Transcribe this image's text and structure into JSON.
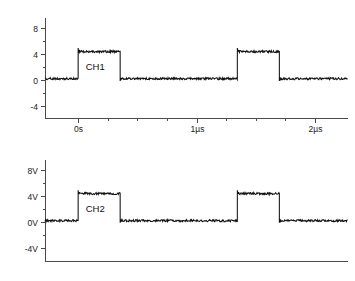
{
  "figure": {
    "title": "",
    "background": "#ffffff",
    "trace_color": "#111111",
    "axis_color": "#4a4a4a"
  },
  "panels": [
    {
      "id": "ch1",
      "channel_label": "CH1",
      "y_ticks": [
        "8",
        "4",
        "0",
        "-4"
      ],
      "y_values": [
        8,
        4,
        0,
        -4
      ],
      "x_ticks": [
        "0s",
        "1µs",
        "2µs"
      ],
      "x_values": [
        0,
        1,
        2
      ]
    },
    {
      "id": "ch2",
      "channel_label": "CH2",
      "y_ticks": [
        "8V",
        "4V",
        "0V",
        "-4V"
      ],
      "y_values": [
        8,
        4,
        0,
        -4
      ],
      "x_ticks": [],
      "x_values": []
    }
  ],
  "chart_data": [
    {
      "type": "line",
      "title": "",
      "xlabel": "",
      "ylabel": "",
      "series_name": "CH1",
      "xlim": [
        -0.28,
        2.28
      ],
      "ylim": [
        -6.2,
        9.6
      ],
      "yticks": [
        8,
        4,
        0,
        -4
      ],
      "yticklabels": [
        "8",
        "4",
        "0",
        "-4"
      ],
      "yminorticks": [
        6,
        2,
        -2
      ],
      "xticks": [
        0,
        1,
        2
      ],
      "xticklabels": [
        "0s",
        "1µs",
        "2µs"
      ],
      "xminorticks": [
        0.25,
        0.5,
        0.75,
        1.25,
        1.5,
        1.75
      ],
      "grid": false,
      "legend": "none",
      "annotations": [
        {
          "text": "CH1",
          "x": 0.03,
          "y": 1.55
        }
      ],
      "waveform": {
        "description": "noisy digital square wave, two positive pulses",
        "low_level": 0.2,
        "high_level": 4.4,
        "overshoot": 0.55,
        "noise_amplitude": 0.16,
        "edges": [
          {
            "t": 0.0,
            "to": "high"
          },
          {
            "t": 0.355,
            "to": "low"
          },
          {
            "t": 1.345,
            "to": "high"
          },
          {
            "t": 1.7,
            "to": "low"
          }
        ],
        "period_us": 1.345,
        "pulse_width_us": 0.355
      }
    },
    {
      "type": "line",
      "title": "",
      "xlabel": "",
      "ylabel": "",
      "series_name": "CH2",
      "xlim": [
        -0.28,
        2.28
      ],
      "ylim": [
        -6.2,
        9.6
      ],
      "yticks": [
        8,
        4,
        0,
        -4
      ],
      "yticklabels": [
        "8V",
        "4V",
        "0V",
        "-4V"
      ],
      "yminorticks": [
        6,
        2,
        -2
      ],
      "xticks": [],
      "xticklabels": [],
      "xminorticks": [],
      "grid": false,
      "legend": "none",
      "annotations": [
        {
          "text": "CH2",
          "x": 0.03,
          "y": 1.55
        }
      ],
      "waveform": {
        "description": "noisy digital square wave, two positive pulses",
        "low_level": 0.2,
        "high_level": 4.4,
        "overshoot": 0.5,
        "noise_amplitude": 0.16,
        "edges": [
          {
            "t": 0.0,
            "to": "high"
          },
          {
            "t": 0.355,
            "to": "low"
          },
          {
            "t": 1.345,
            "to": "high"
          },
          {
            "t": 1.7,
            "to": "low"
          }
        ],
        "period_us": 1.345,
        "pulse_width_us": 0.355
      }
    }
  ]
}
